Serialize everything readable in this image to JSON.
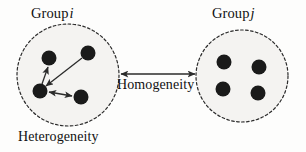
{
  "figure": {
    "width": 306,
    "height": 152,
    "background_color": "#fdfdfc"
  },
  "labels": {
    "group_i_prefix": "Group",
    "group_i_symbol": "i",
    "group_j_prefix": "Group",
    "group_j_symbol": "j",
    "homogeneity": "Homogeneity",
    "heterogeneity": "Heterogeneity"
  },
  "watermark": {
    "line_1": "",
    "line_2": ""
  },
  "colors": {
    "node_fill": "#1a1a1a",
    "circle_fill": "#f4f3f1",
    "circle_stroke": "#2b2b2b",
    "arrow_stroke": "#2b2b2b",
    "text": "#111111"
  },
  "diagram_data": {
    "type": "diagram",
    "groups": [
      {
        "id": "group-i",
        "label": "Group i",
        "caption": "Heterogeneity",
        "circle": {
          "cx": 68,
          "cy": 75,
          "r": 51
        },
        "style": "dashed",
        "nodes": [
          {
            "id": "i-top-left",
            "cx": 49,
            "cy": 58,
            "r": 7.5
          },
          {
            "id": "i-top-right",
            "cx": 88,
            "cy": 53,
            "r": 7.5
          },
          {
            "id": "i-hub",
            "cx": 40,
            "cy": 91,
            "r": 7.5
          },
          {
            "id": "i-bottom-right",
            "cx": 81,
            "cy": 97,
            "r": 7.5
          }
        ],
        "edges": [
          {
            "from": "i-hub",
            "to": "i-top-left",
            "arrow": "single"
          },
          {
            "from": "i-top-right",
            "to": "i-hub",
            "arrow": "single"
          },
          {
            "from": "i-hub",
            "to": "i-bottom-right",
            "arrow": "double"
          }
        ]
      },
      {
        "id": "group-j",
        "label": "Group j",
        "caption": "",
        "circle": {
          "cx": 242,
          "cy": 76,
          "r": 46
        },
        "style": "dashed",
        "nodes": [
          {
            "id": "j-top-left",
            "cx": 224,
            "cy": 62,
            "r": 7.5
          },
          {
            "id": "j-top-right",
            "cx": 259,
            "cy": 67,
            "r": 7.5
          },
          {
            "id": "j-bottom-left",
            "cx": 223,
            "cy": 89,
            "r": 7.5
          },
          {
            "id": "j-bottom-right",
            "cx": 258,
            "cy": 93,
            "r": 7.5
          }
        ],
        "edges": []
      }
    ],
    "connector": {
      "label": "Homogeneity",
      "arrow": "double",
      "x1": 121,
      "x2": 195,
      "y": 74
    }
  }
}
